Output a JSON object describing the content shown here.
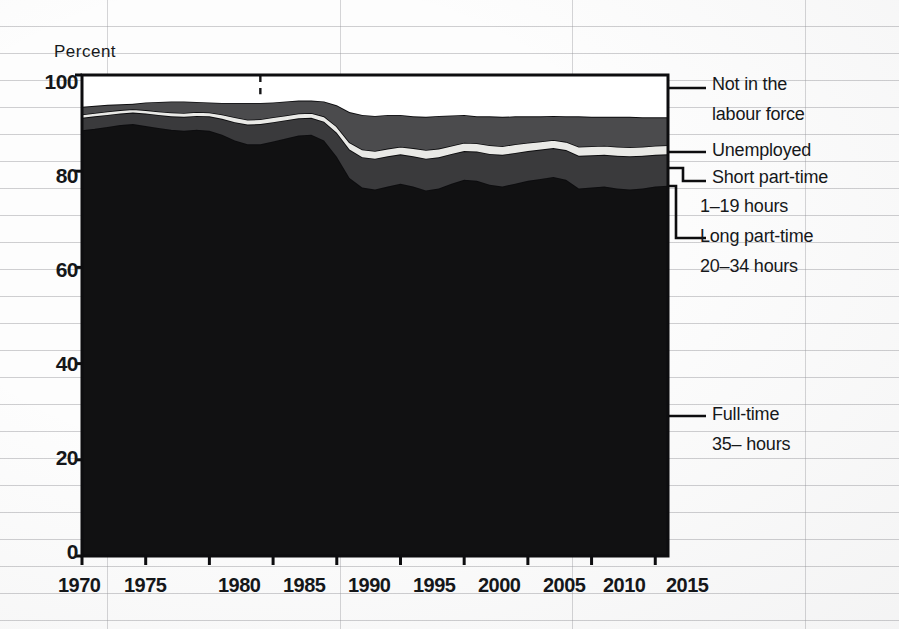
{
  "figure": {
    "y_axis_title": "Percent",
    "y_ticks": [
      "100",
      "80",
      "60",
      "40",
      "20",
      "0"
    ],
    "x_ticks": [
      "1970",
      "1975",
      "1980",
      "1985",
      "1990",
      "1995",
      "2000",
      "2005",
      "2010",
      "2015"
    ],
    "colors": {
      "not_in_labour_force": "#ffffff",
      "unemployed": "#4b4b4d",
      "short_part_time": "#e9e9e6",
      "long_part_time": "#3a3a3c",
      "full_time": "#111112",
      "outline": "#0d0d0f",
      "grid": "#9a9a9f"
    }
  },
  "legend": [
    {
      "key": "not_in_labour_force",
      "label": "Not in the",
      "sub": "labour force"
    },
    {
      "key": "unemployed",
      "label": "Unemployed",
      "sub": ""
    },
    {
      "key": "short_part_time",
      "label": "Short part-time",
      "sub": "1–19 hours"
    },
    {
      "key": "long_part_time",
      "label": "Long part-time",
      "sub": "20–34 hours"
    },
    {
      "key": "full_time",
      "label": "Full-time",
      "sub": "35– hours"
    }
  ],
  "chart_data": {
    "type": "area",
    "title": "",
    "subtitle": "",
    "xlabel": "",
    "ylabel": "Percent",
    "ylim": [
      0,
      100
    ],
    "xlim": [
      1970,
      2016
    ],
    "grid": true,
    "legend_position": "right",
    "stacking": "cumulative-to-100",
    "annotations": [
      {
        "type": "vertical-dashed-line",
        "x": 1984,
        "label": ""
      }
    ],
    "x": [
      1970,
      1971,
      1972,
      1973,
      1974,
      1975,
      1976,
      1977,
      1978,
      1979,
      1980,
      1981,
      1982,
      1983,
      1984,
      1985,
      1986,
      1987,
      1988,
      1989,
      1990,
      1991,
      1992,
      1993,
      1994,
      1995,
      1996,
      1997,
      1998,
      1999,
      2000,
      2001,
      2002,
      2003,
      2004,
      2005,
      2006,
      2007,
      2008,
      2009,
      2010,
      2011,
      2012,
      2013,
      2014,
      2015,
      2016
    ],
    "series": [
      {
        "name": "Full-time 35– hours",
        "color": "#111112",
        "values": [
          88.5,
          88.8,
          89.2,
          89.6,
          89.8,
          89.4,
          89.0,
          88.6,
          88.4,
          88.6,
          88.4,
          87.6,
          86.4,
          85.6,
          85.6,
          86.2,
          86.8,
          87.4,
          87.6,
          86.4,
          83.0,
          78.6,
          76.6,
          76.2,
          76.8,
          77.4,
          76.8,
          76.0,
          76.4,
          77.4,
          78.2,
          78.0,
          77.2,
          76.8,
          77.4,
          78.0,
          78.4,
          78.8,
          78.2,
          76.4,
          76.6,
          76.8,
          76.4,
          76.2,
          76.4,
          76.8,
          77.0
        ]
      },
      {
        "name": "Long part-time 20–34 hours",
        "color": "#3a3a3c",
        "values": [
          2.6,
          2.6,
          2.5,
          2.4,
          2.4,
          2.6,
          2.7,
          2.8,
          2.9,
          2.9,
          3.0,
          3.3,
          3.8,
          4.1,
          4.2,
          4.0,
          3.8,
          3.6,
          3.5,
          3.9,
          5.0,
          5.9,
          6.3,
          6.4,
          6.3,
          6.1,
          6.3,
          6.6,
          6.5,
          6.2,
          6.0,
          6.1,
          6.4,
          6.6,
          6.4,
          6.2,
          6.1,
          6.0,
          6.2,
          6.8,
          6.7,
          6.6,
          6.8,
          6.9,
          6.8,
          6.6,
          6.5
        ]
      },
      {
        "name": "Short part-time 1–19 hours",
        "color": "#e9e9e6",
        "values": [
          0.7,
          0.7,
          0.7,
          0.7,
          0.7,
          0.7,
          0.7,
          0.8,
          0.8,
          0.8,
          0.8,
          0.9,
          1.0,
          1.0,
          1.0,
          1.0,
          1.0,
          1.0,
          1.0,
          1.1,
          1.3,
          1.5,
          1.6,
          1.6,
          1.6,
          1.6,
          1.7,
          1.8,
          1.8,
          1.7,
          1.7,
          1.7,
          1.8,
          1.8,
          1.8,
          1.7,
          1.7,
          1.7,
          1.7,
          1.9,
          1.9,
          1.9,
          1.9,
          1.9,
          1.9,
          1.9,
          1.9
        ]
      },
      {
        "name": "Unemployed",
        "color": "#4b4b4d",
        "values": [
          1.6,
          1.5,
          1.4,
          1.2,
          1.1,
          1.6,
          2.0,
          2.3,
          2.4,
          2.1,
          2.1,
          2.4,
          3.0,
          3.5,
          3.4,
          3.1,
          2.9,
          2.7,
          2.6,
          3.1,
          4.4,
          6.3,
          7.2,
          7.3,
          7.0,
          6.6,
          6.6,
          6.9,
          6.8,
          6.3,
          5.8,
          5.6,
          6.0,
          6.1,
          5.8,
          5.5,
          5.2,
          5.0,
          5.3,
          6.3,
          6.1,
          6.0,
          6.2,
          6.3,
          6.1,
          5.9,
          5.8
        ]
      },
      {
        "name": "Not in the labour force",
        "color": "#ffffff",
        "values": [
          6.6,
          6.4,
          6.2,
          6.1,
          6.0,
          5.7,
          5.6,
          5.5,
          5.5,
          5.6,
          5.7,
          5.8,
          5.8,
          5.8,
          5.8,
          5.7,
          5.5,
          5.3,
          5.3,
          5.5,
          6.3,
          7.7,
          8.3,
          8.5,
          8.3,
          8.3,
          8.6,
          8.7,
          8.5,
          8.4,
          8.3,
          8.6,
          8.6,
          8.7,
          8.6,
          8.6,
          8.6,
          8.5,
          8.6,
          8.6,
          8.7,
          8.7,
          8.7,
          8.7,
          8.8,
          8.8,
          8.8
        ]
      }
    ]
  }
}
